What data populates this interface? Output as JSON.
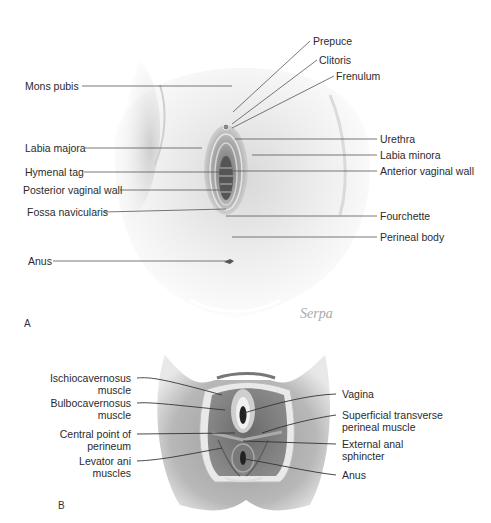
{
  "panel_a": {
    "letter": "A",
    "signature": "Serpa",
    "labels_left": [
      {
        "text": "Mons pubis",
        "x": 25,
        "y": 80
      },
      {
        "text": "Labia majora",
        "x": 25,
        "y": 142
      },
      {
        "text": "Hymenal tag",
        "x": 25,
        "y": 166
      },
      {
        "text": "Posterior vaginal wall",
        "x": 23,
        "y": 184
      },
      {
        "text": "Fossa navicularis",
        "x": 27,
        "y": 206
      },
      {
        "text": "Anus",
        "x": 28,
        "y": 255
      }
    ],
    "labels_right": [
      {
        "text": "Prepuce",
        "x": 313,
        "y": 35
      },
      {
        "text": "Clitoris",
        "x": 319,
        "y": 54
      },
      {
        "text": "Frenulum",
        "x": 336,
        "y": 70
      },
      {
        "text": "Urethra",
        "x": 380,
        "y": 133
      },
      {
        "text": "Labia minora",
        "x": 380,
        "y": 149
      },
      {
        "text": "Anterior vaginal wall",
        "x": 380,
        "y": 165
      },
      {
        "text": "Fourchette",
        "x": 380,
        "y": 210
      },
      {
        "text": "Perineal body",
        "x": 380,
        "y": 231
      }
    ]
  },
  "panel_b": {
    "letter": "B",
    "labels_left": [
      {
        "lines": [
          "Ischiocavernosus",
          "muscle"
        ]
      },
      {
        "lines": [
          "Bulbocavernosus",
          "muscle"
        ]
      },
      {
        "lines": [
          "Central point of",
          "perineum"
        ]
      },
      {
        "lines": [
          "Levator ani",
          "muscles"
        ]
      }
    ],
    "labels_right": [
      {
        "lines": [
          "Vagina"
        ]
      },
      {
        "lines": [
          "Superficial transverse",
          "perineal muscle"
        ]
      },
      {
        "lines": [
          "External anal",
          "sphincter"
        ]
      },
      {
        "lines": [
          "Anus"
        ]
      }
    ]
  }
}
